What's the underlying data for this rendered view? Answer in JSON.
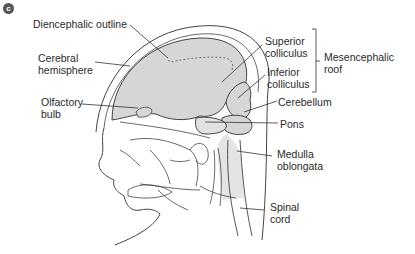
{
  "figure": {
    "panel_letter": "c",
    "colors": {
      "brain_fill": "#d6d6d6",
      "outline": "#444444",
      "leader_line": "#333333",
      "badge": "#555555"
    },
    "labels": {
      "diencephalic_outline": "Diencephalic outline",
      "cerebral_hemisphere": "Cerebral\nhemisphere",
      "olfactory_bulb": "Olfactory\nbulb",
      "superior_colliculus": "Superior\ncolliculus",
      "inferior_colliculus": "Inferior\ncolliculus",
      "mesencephalic_roof": "Mesencephalic\nroof",
      "cerebellum": "Cerebellum",
      "pons": "Pons",
      "medulla_oblongata": "Medulla\noblongata",
      "spinal_cord": "Spinal\ncord"
    }
  }
}
